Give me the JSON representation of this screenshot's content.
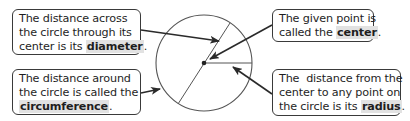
{
  "diagram": {
    "circle": {
      "cx": 204,
      "cy": 63,
      "r": 48,
      "stroke": "#555555"
    },
    "diameter_line": {
      "x1": 230,
      "y1": 23,
      "x2": 178,
      "y2": 104
    },
    "radius_line": {
      "x1": 204,
      "y1": 63,
      "x2": 252,
      "y2": 63
    },
    "center_point": {
      "x": 204,
      "y": 63
    },
    "colors": {
      "text": "#1e1e1e",
      "box_border": "#3a3a3a",
      "keyword_highlight": "#e2e2e2",
      "arrow": "#2a2a2a"
    }
  },
  "callouts": {
    "diameter": {
      "line1": "The distance across",
      "line2": "the circle through its",
      "line3_prefix": "center is its ",
      "keyword": "diameter",
      "suffix": "."
    },
    "circumference": {
      "line1": "The distance around",
      "line2": "the circle is called the",
      "keyword": "circumference",
      "suffix": "."
    },
    "center": {
      "line1": "The given point is",
      "line2_prefix": "called the ",
      "keyword": "center",
      "suffix": "."
    },
    "radius": {
      "line1": "The  distance from the",
      "line2": "center to any point on",
      "line3_prefix": "the circle is its ",
      "keyword": "radius",
      "suffix": "."
    }
  },
  "arrows": [
    {
      "name": "diameter-arrow",
      "from": [
        141,
        30
      ],
      "to": [
        219,
        41
      ]
    },
    {
      "name": "center-arrow",
      "from": [
        272,
        25
      ],
      "to": [
        210,
        59
      ]
    },
    {
      "name": "circumference-arrow",
      "from": [
        141,
        93
      ],
      "to": [
        160,
        89
      ]
    },
    {
      "name": "radius-arrow",
      "from": [
        272,
        94
      ],
      "to": [
        233,
        67
      ]
    }
  ]
}
